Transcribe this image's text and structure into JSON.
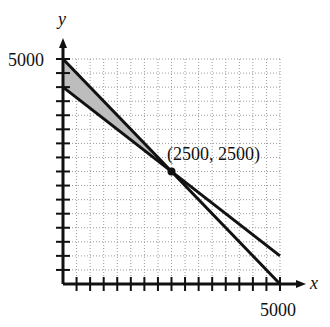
{
  "chart_data": {
    "type": "line",
    "title": "",
    "xlabel": "x",
    "ylabel": "y",
    "xlim": [
      0,
      5000
    ],
    "ylim": [
      0,
      5000
    ],
    "x_tick_labels": [
      "5000"
    ],
    "y_tick_labels": [
      "5000"
    ],
    "tick_count_per_axis": 16,
    "grid": true,
    "grid_style": "dotted",
    "series": [
      {
        "name": "line-1",
        "points": [
          [
            0,
            5000
          ],
          [
            5000,
            0
          ]
        ],
        "equation": "x + y = 5000"
      },
      {
        "name": "line-2",
        "points": [
          [
            0,
            4375
          ],
          [
            5000,
            625
          ]
        ],
        "equation": "y = 4375 - 0.75x"
      }
    ],
    "shaded_region": {
      "vertices": [
        [
          0,
          5000
        ],
        [
          0,
          4375
        ],
        [
          2500,
          2500
        ]
      ],
      "fill": "#bdbdbd"
    },
    "annotations": [
      {
        "text": "(2500, 2500)",
        "point": [
          2500,
          2500
        ]
      }
    ]
  },
  "labels": {
    "x_axis": "x",
    "y_axis": "y",
    "x_max": "5000",
    "y_max": "5000",
    "point": "(2500, 2500)"
  }
}
